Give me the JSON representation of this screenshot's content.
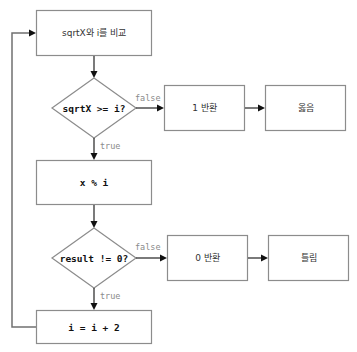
{
  "diagram": {
    "type": "flowchart",
    "nodes": {
      "compare": {
        "label": "sqrtX와 i를 비교",
        "shape": "rect"
      },
      "cond_sqrt": {
        "label": "sqrtX >= i?",
        "shape": "diamond"
      },
      "return_one": {
        "label": "1 반환",
        "shape": "rect"
      },
      "correct": {
        "label": "옳음",
        "shape": "rect"
      },
      "mod": {
        "label": "x % i",
        "shape": "rect"
      },
      "cond_result": {
        "label": "result != 0?",
        "shape": "diamond"
      },
      "return_zero": {
        "label": "0 반환",
        "shape": "rect"
      },
      "wrong": {
        "label": "틀림",
        "shape": "rect"
      },
      "increment": {
        "label": "i = i + 2",
        "shape": "rect"
      }
    },
    "edges": {
      "compare_to_cond_sqrt": {
        "label": ""
      },
      "cond_sqrt_false": {
        "label": "false"
      },
      "cond_sqrt_true": {
        "label": "true"
      },
      "return_one_to_correct": {
        "label": ""
      },
      "mod_to_cond_result": {
        "label": ""
      },
      "cond_result_false": {
        "label": "false"
      },
      "cond_result_true": {
        "label": "true"
      },
      "return_zero_to_wrong": {
        "label": ""
      },
      "increment_loop_to_compare": {
        "label": ""
      }
    },
    "colors": {
      "node_border": "#8c8c8c",
      "edge": "#222222",
      "loop_edge": "#707070",
      "edge_label": "#8a8a8a",
      "background": "#ffffff"
    }
  }
}
